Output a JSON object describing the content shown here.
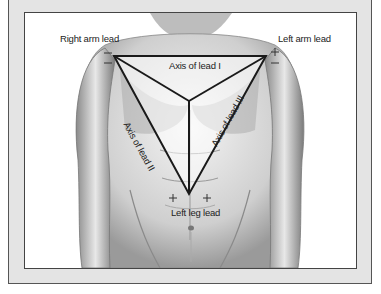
{
  "figure": {
    "labels": {
      "right_arm_lead": "Right arm lead",
      "left_arm_lead": "Left arm lead",
      "left_leg_lead": "Left leg lead",
      "axis_lead_1": "Axis of lead I",
      "axis_lead_2": "Axis of lead II",
      "axis_lead_3": "Axis of lead III"
    },
    "polarity": {
      "right_arm": [
        "−",
        "−"
      ],
      "left_arm": [
        "+",
        "−"
      ],
      "left_leg": [
        "+",
        "+"
      ]
    },
    "colors": {
      "frame_bg": "#e4e4e4",
      "frame_border": "#555555",
      "panel_bg": "#ffffff",
      "triangle_stroke": "#1a1a1a",
      "text": "#222222"
    }
  }
}
